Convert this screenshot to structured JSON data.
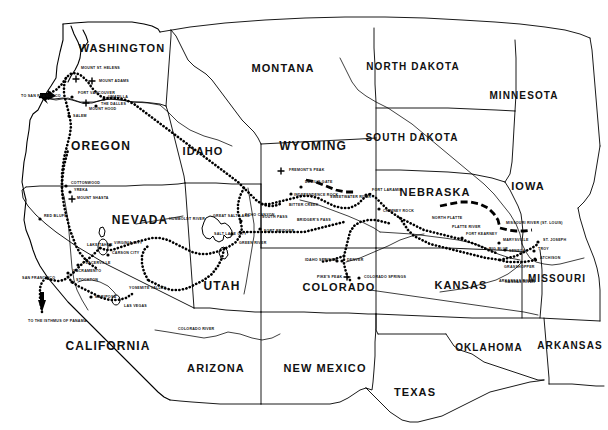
{
  "map": {
    "title": "Western United States Overland Trails Map",
    "background_color": "#ffffff",
    "ink_color": "#000000",
    "states": [
      {
        "name": "WASHINGTON",
        "x": 122,
        "y": 52,
        "size": 11
      },
      {
        "name": "MONTANA",
        "x": 283,
        "y": 72,
        "size": 11
      },
      {
        "name": "NORTH DAKOTA",
        "x": 413,
        "y": 70,
        "size": 10
      },
      {
        "name": "MINNESOTA",
        "x": 524,
        "y": 99,
        "size": 10
      },
      {
        "name": "OREGON",
        "x": 101,
        "y": 150,
        "size": 12
      },
      {
        "name": "IDAHO",
        "x": 203,
        "y": 155,
        "size": 11
      },
      {
        "name": "WYOMING",
        "x": 313,
        "y": 150,
        "size": 12
      },
      {
        "name": "SOUTH DAKOTA",
        "x": 412,
        "y": 141,
        "size": 10
      },
      {
        "name": "NEBRASKA",
        "x": 435,
        "y": 196,
        "size": 11
      },
      {
        "name": "IOWA",
        "x": 528,
        "y": 190,
        "size": 11
      },
      {
        "name": "NEVADA",
        "x": 140,
        "y": 224,
        "size": 12
      },
      {
        "name": "UTAH",
        "x": 222,
        "y": 290,
        "size": 12
      },
      {
        "name": "COLORADO",
        "x": 339,
        "y": 291,
        "size": 11
      },
      {
        "name": "KANSAS",
        "x": 461,
        "y": 289,
        "size": 11
      },
      {
        "name": "MISSOURI",
        "x": 557,
        "y": 282,
        "size": 10
      },
      {
        "name": "CALIFORNIA",
        "x": 108,
        "y": 350,
        "size": 12
      },
      {
        "name": "ARIZONA",
        "x": 216,
        "y": 372,
        "size": 11
      },
      {
        "name": "NEW MEXICO",
        "x": 325,
        "y": 372,
        "size": 11
      },
      {
        "name": "TEXAS",
        "x": 415,
        "y": 396,
        "size": 11
      },
      {
        "name": "OKLAHOMA",
        "x": 489,
        "y": 351,
        "size": 10
      },
      {
        "name": "ARKANSAS",
        "x": 570,
        "y": 349,
        "size": 10
      }
    ],
    "places": [
      {
        "name": "MOUNT ST. HELENS",
        "x": 81,
        "y": 69,
        "marker": "peak",
        "mx": 76,
        "my": 79
      },
      {
        "name": "MOUNT ADAMS",
        "x": 99,
        "y": 82,
        "marker": "peak",
        "mx": 92,
        "my": 81
      },
      {
        "name": "FORT VANCOUVER",
        "x": 78,
        "y": 94,
        "marker": "dot",
        "mx": 72,
        "my": 97
      },
      {
        "name": "MOUNT HOOD",
        "x": 89,
        "y": 110,
        "marker": "peak",
        "mx": 86,
        "my": 103
      },
      {
        "name": "UMATILLA",
        "x": 108,
        "y": 98,
        "marker": "dot",
        "mx": 104,
        "my": 99
      },
      {
        "name": "THE DALLES",
        "x": 101,
        "y": 105,
        "marker": "dot",
        "mx": 96,
        "my": 106
      },
      {
        "name": "SALEM",
        "x": 73,
        "y": 117,
        "marker": "dot",
        "mx": 69,
        "my": 116
      },
      {
        "name": "COTTONWOOD",
        "x": 71,
        "y": 184,
        "marker": "dot",
        "mx": 66,
        "my": 186
      },
      {
        "name": "YREKA",
        "x": 74,
        "y": 191,
        "marker": "dot",
        "mx": 70,
        "my": 192
      },
      {
        "name": "MOUNT SHASTA",
        "x": 77,
        "y": 199,
        "marker": "peak",
        "mx": 72,
        "my": 199
      },
      {
        "name": "RED BLUFF",
        "x": 44,
        "y": 217,
        "marker": "dot",
        "mx": 40,
        "my": 219
      },
      {
        "name": "LAKE TAHOE",
        "x": 87,
        "y": 246,
        "marker": "none",
        "mx": 0,
        "my": 0
      },
      {
        "name": "VIRGINIA CITY",
        "x": 114,
        "y": 244,
        "marker": "dot",
        "mx": 110,
        "my": 245
      },
      {
        "name": "CARSON CITY",
        "x": 112,
        "y": 254,
        "marker": "dot",
        "mx": 108,
        "my": 255
      },
      {
        "name": "PLACERVILLE",
        "x": 83,
        "y": 264,
        "marker": "dot",
        "mx": 78,
        "my": 265
      },
      {
        "name": "SACRAMENTO",
        "x": 73,
        "y": 272,
        "marker": "dot",
        "mx": 68,
        "my": 273
      },
      {
        "name": "STOCKTON",
        "x": 76,
        "y": 281,
        "marker": "dot",
        "mx": 72,
        "my": 282
      },
      {
        "name": "YOSEMITE VALLEY",
        "x": 129,
        "y": 289,
        "marker": "none",
        "mx": 0,
        "my": 0
      },
      {
        "name": "MARIPOSA",
        "x": 95,
        "y": 298,
        "marker": "dot",
        "mx": 91,
        "my": 297
      },
      {
        "name": "LAS VEGAS",
        "x": 124,
        "y": 307,
        "marker": "none",
        "mx": 0,
        "my": 0
      },
      {
        "name": "SAN FRANCISCO",
        "x": 22,
        "y": 279,
        "marker": "none",
        "mx": 0,
        "my": 0
      },
      {
        "name": "TO SAN FRANCISCO",
        "x": 21,
        "y": 97,
        "marker": "none",
        "mx": 0,
        "my": 0
      },
      {
        "name": "TO THE ISTHMUS OF PANAMA",
        "x": 28,
        "y": 322,
        "marker": "none",
        "mx": 0,
        "my": 0
      },
      {
        "name": "GREAT SALT LAKE",
        "x": 213,
        "y": 217,
        "marker": "none",
        "mx": 0,
        "my": 0
      },
      {
        "name": "SALT LAKE CITY",
        "x": 214,
        "y": 235,
        "marker": "dot",
        "mx": 232,
        "my": 234
      },
      {
        "name": "ECHO CANYON",
        "x": 245,
        "y": 216,
        "marker": "dot",
        "mx": 241,
        "my": 221
      },
      {
        "name": "FORT BRIDGER",
        "x": 264,
        "y": 232,
        "marker": "dot",
        "mx": 260,
        "my": 229
      },
      {
        "name": "GREEN RIVER",
        "x": 239,
        "y": 244,
        "marker": "none",
        "mx": 0,
        "my": 0
      },
      {
        "name": "FREMONT'S PEAK",
        "x": 289,
        "y": 171,
        "marker": "peak",
        "mx": 281,
        "my": 171
      },
      {
        "name": "DEVIL'S GATE",
        "x": 305,
        "y": 183,
        "marker": "dot",
        "mx": 301,
        "my": 187
      },
      {
        "name": "INDEPENDENCE ROCK",
        "x": 294,
        "y": 196,
        "marker": "dot",
        "mx": 291,
        "my": 194
      },
      {
        "name": "BITTER CREEK",
        "x": 289,
        "y": 206,
        "marker": "none",
        "mx": 0,
        "my": 0
      },
      {
        "name": "BRIDGER'S PASS",
        "x": 297,
        "y": 221,
        "marker": "none",
        "mx": 0,
        "my": 0
      },
      {
        "name": "SOUTH PASS",
        "x": 262,
        "y": 218,
        "marker": "none",
        "mx": 0,
        "my": 0
      },
      {
        "name": "SWEETWATER RIVER",
        "x": 330,
        "y": 198,
        "marker": "none",
        "mx": 0,
        "my": 0
      },
      {
        "name": "FORT LARAMIE",
        "x": 372,
        "y": 191,
        "marker": "dot",
        "mx": 366,
        "my": 195
      },
      {
        "name": "CHIMNEY ROCK",
        "x": 383,
        "y": 212,
        "marker": "dot",
        "mx": 379,
        "my": 209
      },
      {
        "name": "NORTH PLATTE",
        "x": 432,
        "y": 219,
        "marker": "none",
        "mx": 0,
        "my": 0
      },
      {
        "name": "PLATTE RIVER",
        "x": 452,
        "y": 228,
        "marker": "none",
        "mx": 0,
        "my": 0
      },
      {
        "name": "FORT KEARNEY",
        "x": 466,
        "y": 235,
        "marker": "dot",
        "mx": 462,
        "my": 238
      },
      {
        "name": "BIG BLUE",
        "x": 489,
        "y": 250,
        "marker": "none",
        "mx": 0,
        "my": 0
      },
      {
        "name": "MARYSVILLE",
        "x": 503,
        "y": 241,
        "marker": "dot",
        "mx": 499,
        "my": 243
      },
      {
        "name": "SENECA",
        "x": 509,
        "y": 252,
        "marker": "dot",
        "mx": 505,
        "my": 250
      },
      {
        "name": "ST. JOSEPH",
        "x": 543,
        "y": 241,
        "marker": "dot",
        "mx": 538,
        "my": 242
      },
      {
        "name": "TROY",
        "x": 538,
        "y": 250,
        "marker": "dot",
        "mx": 534,
        "my": 251
      },
      {
        "name": "ATCHISON",
        "x": 540,
        "y": 259,
        "marker": "dot",
        "mx": 535,
        "my": 259
      },
      {
        "name": "GRASSHOPPER",
        "x": 504,
        "y": 268,
        "marker": "none",
        "mx": 0,
        "my": 0
      },
      {
        "name": "IDAHO SPRINGS",
        "x": 305,
        "y": 261,
        "marker": "dot",
        "mx": 337,
        "my": 261
      },
      {
        "name": "DENVER",
        "x": 347,
        "y": 261,
        "marker": "dot",
        "mx": 342,
        "my": 261
      },
      {
        "name": "PIKE'S PEAK",
        "x": 317,
        "y": 278,
        "marker": "peak",
        "mx": 347,
        "my": 277
      },
      {
        "name": "COLORADO SPRINGS",
        "x": 364,
        "y": 278,
        "marker": "dot",
        "mx": 359,
        "my": 278
      },
      {
        "name": "MISSOURI RIVER (ST. LOUIS)",
        "x": 506,
        "y": 224,
        "marker": "none",
        "mx": 0,
        "my": 0
      },
      {
        "name": "COLORADO RIVER",
        "x": 178,
        "y": 330,
        "marker": "none",
        "mx": 0,
        "my": 0
      },
      {
        "name": "ARKANSAS RIVER",
        "x": 499,
        "y": 282,
        "marker": "none",
        "mx": 0,
        "my": 0
      },
      {
        "name": "KANSAS RIVER",
        "x": 505,
        "y": 283,
        "marker": "none",
        "mx": 0,
        "my": 0
      },
      {
        "name": "HUMBOLDT RIVER",
        "x": 169,
        "y": 220,
        "marker": "none",
        "mx": 0,
        "my": 0
      }
    ],
    "legend_note": ""
  }
}
